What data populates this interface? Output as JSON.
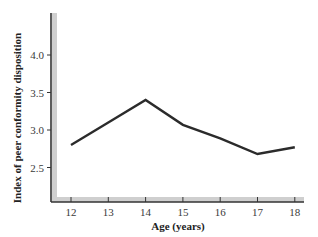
{
  "chart_data": {
    "type": "line",
    "title": "",
    "xlabel": "Age (years)",
    "ylabel": "Index of peer conformity disposition",
    "x": [
      12,
      13,
      14,
      15,
      16,
      17,
      18
    ],
    "series": [
      {
        "name": "Peer conformity disposition",
        "values": [
          2.8,
          3.1,
          3.4,
          3.07,
          2.89,
          2.68,
          2.77
        ],
        "color": "#2b2b2b"
      }
    ],
    "x_ticks": [
      "12",
      "13",
      "14",
      "15",
      "16",
      "17",
      "18"
    ],
    "y_ticks": [
      "2.5",
      "3.0",
      "3.5",
      "4.0"
    ],
    "xlim": [
      11.5,
      18.1
    ],
    "ylim": [
      2.05,
      4.65
    ],
    "grid": false,
    "legend": "none"
  },
  "colors": {
    "line": "#2b2b2b",
    "axis": "#333333",
    "axis_shadow": "#c8c8c8",
    "text": "#3a3a3a"
  }
}
